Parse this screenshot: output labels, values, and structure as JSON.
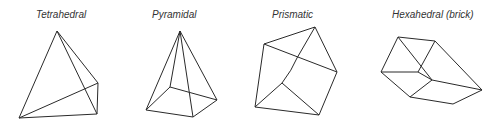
{
  "labels": {
    "tetrahedral": "Tetrahedral",
    "pyramidal": "Pyramidal",
    "prismatic": "Prismatic",
    "hexahedral": "Hexahedral (brick)"
  },
  "colors": {
    "stroke": "#2a2a2a",
    "text": "#333333",
    "background": "#ffffff"
  }
}
